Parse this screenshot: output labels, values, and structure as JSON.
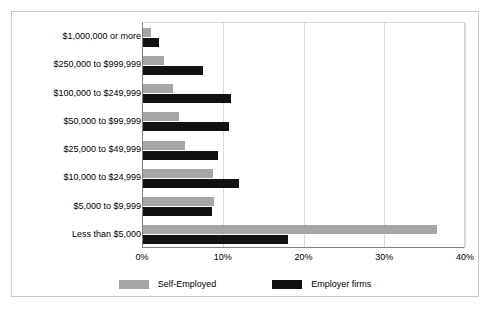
{
  "chart_data": {
    "type": "bar",
    "orientation": "horizontal",
    "title": "",
    "xlabel": "",
    "ylabel": "",
    "xlim": [
      0,
      40
    ],
    "xunit": "%",
    "xticks": [
      "0%",
      "10%",
      "20%",
      "30%",
      "40%"
    ],
    "xtick_values": [
      0,
      10,
      20,
      30,
      40
    ],
    "grid": true,
    "grid_axis": "x",
    "legend_position": "bottom",
    "categories": [
      "$1,000,000 or more",
      "$250,000 to $999,999",
      "$100,000 to $249,999",
      "$50,000 to $99,999",
      "$25,000 to $49,999",
      "$10,000 to $24,999",
      "$5,000 to $9,999",
      "Less than $5,000"
    ],
    "series": [
      {
        "name": "Self-Employed",
        "color": "#a6a6a6",
        "values": [
          1.0,
          2.6,
          3.7,
          4.4,
          5.2,
          8.7,
          8.8,
          36.4
        ]
      },
      {
        "name": "Employer firms",
        "color": "#111111",
        "values": [
          2.0,
          7.4,
          10.9,
          10.7,
          9.3,
          11.9,
          8.6,
          18.0
        ]
      }
    ]
  }
}
